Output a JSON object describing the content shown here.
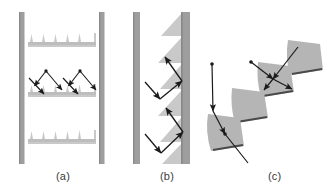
{
  "figure": {
    "type": "scientific-diagram",
    "title": "",
    "background_color": "#ffffff",
    "width": 335,
    "height": 196,
    "colors": {
      "wall": "#9e9e9e",
      "wall_edge": "#8a8a8a",
      "structure": "#c9c9c9",
      "structure_light": "#d6d6d6",
      "blade": "#b5b5b5",
      "blade_edge": "#4a4a4a",
      "ray": "#1a1a1a",
      "caption_text": "#3c3c3c"
    },
    "panels": [
      {
        "id": "a",
        "caption": "(a)",
        "description": "Two parallel vertical walls with three horizontal comb/sawtooth structures between them; rays enter from upper left and right and bounce off the middle comb.",
        "walls": [
          {
            "name": "left-wall",
            "x": 19,
            "y": 12,
            "w": 5,
            "h": 152
          },
          {
            "name": "right-wall",
            "x": 99,
            "y": 12,
            "w": 5,
            "h": 152
          }
        ],
        "combs": [
          {
            "name": "upper-comb",
            "x": 28,
            "y": 33,
            "w": 70,
            "teeth": 5
          },
          {
            "name": "middle-comb",
            "x": 28,
            "y": 87,
            "w": 70,
            "teeth": 5
          },
          {
            "name": "lower-comb",
            "x": 28,
            "y": 130,
            "w": 70,
            "teeth": 5
          }
        ],
        "rays": [
          {
            "name": "ray-left-incoming",
            "points": "46,72 34,87"
          },
          {
            "name": "ray-left-reflected",
            "points": "34,87 44,96"
          },
          {
            "name": "ray-left-secondary",
            "points": "46,72 62,92"
          },
          {
            "name": "ray-right-incoming",
            "points": "80,72 68,87"
          },
          {
            "name": "ray-right-reflected",
            "points": "68,87 78,96"
          },
          {
            "name": "ray-right-secondary",
            "points": "80,72 96,92"
          }
        ]
      },
      {
        "id": "b",
        "caption": "(b)",
        "description": "Two parallel vertical walls; the right wall carries leftward-pointing sawtooth teeth. Rays enter from the left wall, reflect off the sawtooth faces in a zig-zag.",
        "walls": [
          {
            "name": "left-wall",
            "x": 133,
            "y": 12,
            "w": 7,
            "h": 152
          },
          {
            "name": "right-wall",
            "x": 181,
            "y": 12,
            "w": 9,
            "h": 152
          }
        ],
        "sawtooth": {
          "name": "right-wall-sawtooth",
          "x_base": 181,
          "teeth": 6,
          "tooth_height": 26,
          "tooth_depth": 22,
          "y_start": 14
        },
        "rays": [
          {
            "name": "ray-upper-incoming",
            "points": "146,83 160,99"
          },
          {
            "name": "ray-upper-reflected",
            "points": "160,99 183,82"
          },
          {
            "name": "ray-upper-outgoing",
            "points": "183,82 165,57"
          },
          {
            "name": "ray-lower-incoming",
            "points": "146,134 161,153"
          },
          {
            "name": "ray-lower-reflected",
            "points": "161,153 184,132"
          },
          {
            "name": "ray-lower-outgoing",
            "points": "184,132 166,108"
          }
        ]
      },
      {
        "id": "c",
        "caption": "(c)",
        "description": "Four fan/wedge-shaped blades arranged along a diagonal from lower-left to upper-right, each with a dark tip edge; rays enter and reflect between successive blades.",
        "blades": [
          {
            "name": "blade-1",
            "position": "lower-left"
          },
          {
            "name": "blade-2",
            "position": "lower-middle"
          },
          {
            "name": "blade-3",
            "position": "upper-middle"
          },
          {
            "name": "blade-4",
            "position": "upper-right"
          }
        ],
        "rays": [
          {
            "name": "ray-left-vertical-incoming",
            "points": "212,66 213,112"
          },
          {
            "name": "ray-left-reflected",
            "points": "213,112 225,135"
          },
          {
            "name": "ray-left-outgoing",
            "points": "225,135 248,163"
          },
          {
            "name": "ray-right-incoming",
            "points": "296,49 272,80"
          },
          {
            "name": "ray-right-reflected",
            "points": "272,80 292,90"
          },
          {
            "name": "ray-mid-incoming",
            "points": "251,63 272,80"
          },
          {
            "name": "ray-mid-reflected",
            "points": "272,80 262,92"
          }
        ]
      }
    ]
  }
}
